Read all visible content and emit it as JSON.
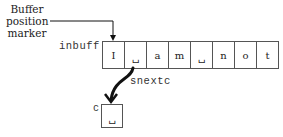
{
  "marker": {
    "line1": "Buffer",
    "line2": "position",
    "line3": "marker"
  },
  "buffer": {
    "label": "inbuff",
    "cells": [
      "I",
      "␣",
      "a",
      "m",
      "␣",
      "n",
      "o",
      "t"
    ],
    "marked_index": 1
  },
  "operation": {
    "label": "snextc"
  },
  "variable": {
    "label": "c",
    "value": "␣"
  },
  "colors": {
    "line": "#111111",
    "border": "#555555",
    "text": "#222222"
  }
}
